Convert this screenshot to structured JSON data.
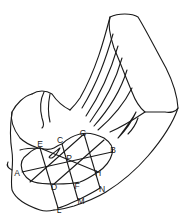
{
  "figure": {
    "type": "line-drawing",
    "stroke_color": "#1a1a1a",
    "background": "#ffffff"
  },
  "labels": [
    {
      "id": "A",
      "text": "A",
      "x": 17,
      "y": 173
    },
    {
      "id": "B",
      "text": "B",
      "x": 113,
      "y": 150
    },
    {
      "id": "C",
      "text": "C",
      "x": 60,
      "y": 140
    },
    {
      "id": "D",
      "text": "D",
      "x": 54,
      "y": 187
    },
    {
      "id": "E",
      "text": "E",
      "x": 40,
      "y": 144
    },
    {
      "id": "F",
      "text": "F",
      "x": 77,
      "y": 186
    },
    {
      "id": "G",
      "text": "G",
      "x": 83,
      "y": 133
    },
    {
      "id": "H",
      "text": "H",
      "x": 98,
      "y": 173
    },
    {
      "id": "L",
      "text": "L",
      "x": 59,
      "y": 210
    },
    {
      "id": "M",
      "text": "M",
      "x": 81,
      "y": 201
    },
    {
      "id": "N",
      "text": "N",
      "x": 102,
      "y": 189
    },
    {
      "id": "P",
      "text": "P",
      "x": 69,
      "y": 158
    }
  ]
}
